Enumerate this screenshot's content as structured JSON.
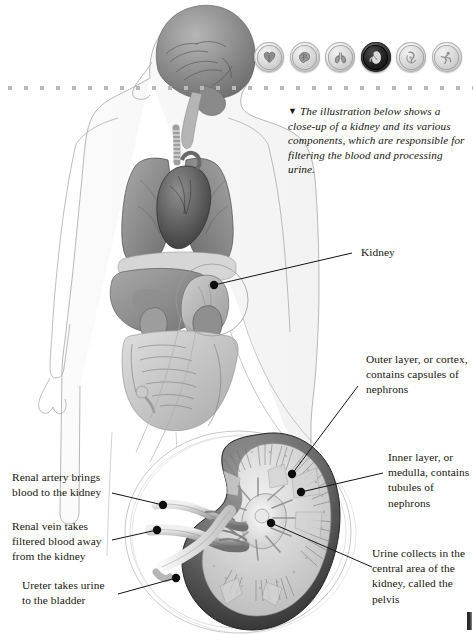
{
  "page": {
    "background_color": "#ffffff",
    "ink_color": "#17170f",
    "folio_partial": "1"
  },
  "icon_row": {
    "items": [
      {
        "name": "heart-icon",
        "label": "Heart",
        "active": false
      },
      {
        "name": "brain-icon",
        "label": "Brain",
        "active": false
      },
      {
        "name": "lungs-icon",
        "label": "Lungs",
        "active": false
      },
      {
        "name": "kidney-icon",
        "label": "Kidney",
        "active": true
      },
      {
        "name": "digestive-icon",
        "label": "Digestive system",
        "active": false
      },
      {
        "name": "runner-icon",
        "label": "Muscles and movement",
        "active": false
      }
    ]
  },
  "caption": {
    "marker": "▼",
    "text": "The illustration below shows a close-up of a kidney and its various components, which are responsible for filtering the blood and processing urine."
  },
  "labels": {
    "kidney": "Kidney",
    "cortex": "Outer layer, or cortex, contains capsules of nephrons",
    "medulla": "Inner layer, or medulla, contains tubules of nephrons",
    "pelvis": "Urine collects in the central area of the kidney, called the pelvis",
    "renal_artery": "Renal artery brings blood to the kidney",
    "renal_vein": "Renal vein takes filtered blood away from the kidney",
    "ureter": "Ureter takes urine to the bladder"
  },
  "figure": {
    "body_caption": "Human body silhouette showing brain, lungs, heart, liver, stomach, intestines and kidneys",
    "inset_caption": "Magnified cross-section of a kidney"
  }
}
